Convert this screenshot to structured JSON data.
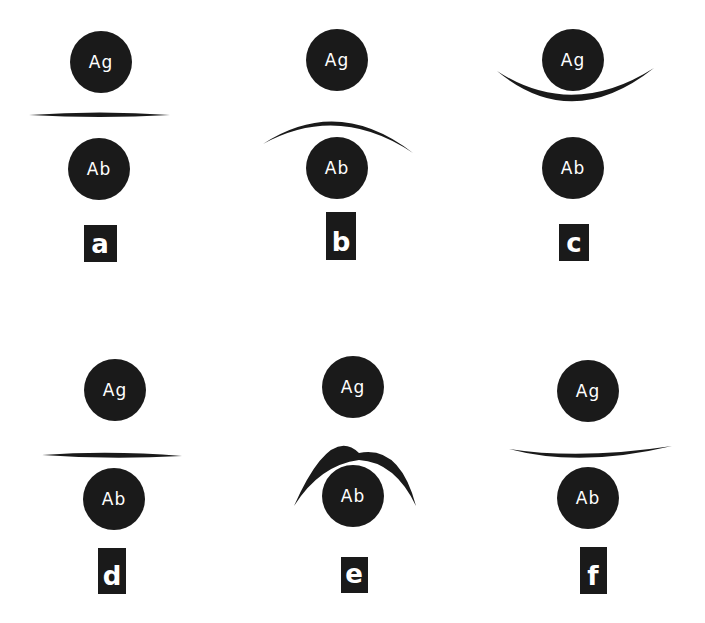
{
  "diagram": {
    "panels": [
      {
        "id": "a",
        "label": "a",
        "top_circle": "Ag",
        "bottom_circle": "Ab",
        "line_shape": "straight"
      },
      {
        "id": "b",
        "label": "b",
        "top_circle": "Ag",
        "bottom_circle": "Ab",
        "line_shape": "convex-up toward Ag"
      },
      {
        "id": "c",
        "label": "c",
        "top_circle": "Ag",
        "bottom_circle": "Ab",
        "line_shape": "concave around Ag"
      },
      {
        "id": "d",
        "label": "d",
        "top_circle": "Ag",
        "bottom_circle": "Ab",
        "line_shape": "straight"
      },
      {
        "id": "e",
        "label": "e",
        "top_circle": "Ag",
        "bottom_circle": "Ab",
        "line_shape": "arc around Ab"
      },
      {
        "id": "f",
        "label": "f",
        "top_circle": "Ag",
        "bottom_circle": "Ab",
        "line_shape": "slight concave up"
      }
    ]
  }
}
